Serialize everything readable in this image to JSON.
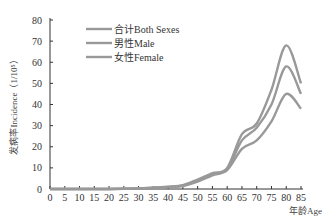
{
  "chart_data": {
    "type": "line",
    "title": "",
    "xlabel": "年龄Age",
    "ylabel": "发病率Incidence（1/10⁵）",
    "xlim": [
      0,
      85
    ],
    "ylim": [
      0,
      80
    ],
    "x_ticks": [
      "0",
      "5",
      "10",
      "15",
      "20",
      "25",
      "30",
      "35",
      "40",
      "45",
      "50",
      "55",
      "60",
      "65",
      "70",
      "75",
      "80",
      "85"
    ],
    "y_ticks": [
      "0",
      "10",
      "20",
      "30",
      "40",
      "50",
      "60",
      "70",
      "80"
    ],
    "grid": false,
    "legend_position": "upper-left",
    "x": [
      0,
      5,
      10,
      15,
      20,
      25,
      30,
      35,
      40,
      45,
      50,
      55,
      60,
      65,
      70,
      75,
      80,
      85
    ],
    "series": [
      {
        "name": "合计Both Sexes",
        "color": "#999999",
        "values": [
          0,
          0,
          0,
          0,
          0,
          0.1,
          0.3,
          0.6,
          1.0,
          1.6,
          4.0,
          7.0,
          9.5,
          23,
          29,
          40,
          58,
          45
        ]
      },
      {
        "name": "男性Male",
        "color": "#999999",
        "values": [
          0,
          0,
          0,
          0,
          0,
          0.1,
          0.3,
          0.6,
          1.1,
          1.8,
          4.5,
          7.5,
          10,
          26,
          31,
          47,
          68,
          50
        ]
      },
      {
        "name": "女性Female",
        "color": "#999999",
        "values": [
          0,
          0,
          0,
          0,
          0,
          0.1,
          0.2,
          0.5,
          0.9,
          1.4,
          3.5,
          6.5,
          9,
          19,
          23,
          32,
          45,
          38
        ]
      }
    ]
  }
}
